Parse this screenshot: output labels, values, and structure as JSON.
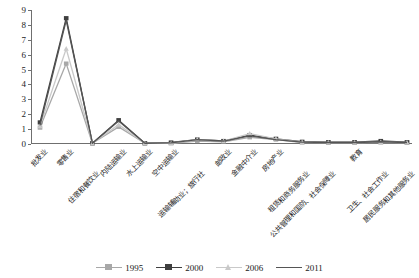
{
  "chart_data": {
    "type": "line",
    "title": "",
    "xlabel": "",
    "ylabel": "",
    "ylim": [
      0,
      9
    ],
    "yticks": [
      0,
      1,
      2,
      3,
      4,
      5,
      6,
      7,
      8,
      9
    ],
    "grid": false,
    "legend_position": "bottom",
    "categories": [
      "批发业",
      "零售业",
      "住宿和餐饮业",
      "内陆运输业",
      "水上运输业",
      "空中运输业",
      "运输辅助业；旅行社",
      "邮政业",
      "金融中介业",
      "房地产业",
      "租赁和商务服务业",
      "公共管理和国防、社会保障业",
      "教育",
      "卫生、社会工作业",
      "居民服务和其他服务业"
    ],
    "series": [
      {
        "name": "1995",
        "color": "#a8a8a8",
        "marker": "square",
        "values": [
          1.1,
          5.4,
          0.05,
          1.15,
          0.05,
          0.05,
          0.2,
          0.15,
          0.45,
          0.3,
          0.1,
          0.1,
          0.1,
          0.1,
          0.1
        ]
      },
      {
        "name": "2000",
        "color": "#3f3f3f",
        "marker": "square",
        "values": [
          1.45,
          8.45,
          0.05,
          1.6,
          0.05,
          0.1,
          0.3,
          0.2,
          0.6,
          0.35,
          0.15,
          0.12,
          0.12,
          0.2,
          0.12
        ]
      },
      {
        "name": "2006",
        "color": "#c9c9c9",
        "marker": "triangle",
        "values": [
          1.2,
          6.4,
          0.05,
          1.3,
          0.05,
          0.05,
          0.3,
          0.2,
          0.7,
          0.35,
          0.12,
          0.1,
          0.1,
          0.12,
          0.1
        ]
      },
      {
        "name": "2011",
        "color": "#555555",
        "marker": "none",
        "values": [
          1.25,
          8.3,
          0.05,
          1.55,
          0.05,
          0.08,
          0.3,
          0.2,
          0.55,
          0.3,
          0.12,
          0.1,
          0.1,
          0.15,
          0.1
        ]
      }
    ]
  },
  "legend": {
    "items": [
      {
        "label": "1995"
      },
      {
        "label": "2000"
      },
      {
        "label": "2006"
      },
      {
        "label": "2011"
      }
    ]
  }
}
